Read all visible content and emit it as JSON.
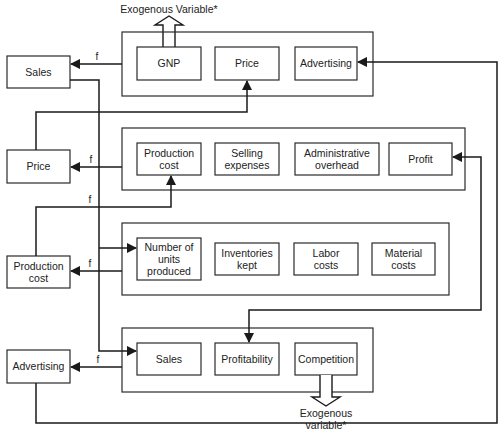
{
  "left_boxes": [
    {
      "label": "Sales"
    },
    {
      "label": "Price"
    },
    {
      "label": "Production",
      "label2": "cost"
    },
    {
      "label": "Advertising"
    }
  ],
  "groups": [
    {
      "items": [
        {
          "label": "GNP"
        },
        {
          "label": "Price"
        },
        {
          "label": "Advertising"
        }
      ]
    },
    {
      "items": [
        {
          "label": "Production",
          "label2": "cost"
        },
        {
          "label": "Selling",
          "label2": "expenses"
        },
        {
          "label": "Administrative",
          "label2": "overhead"
        },
        {
          "label": "Profit"
        }
      ]
    },
    {
      "items": [
        {
          "label": "Number of",
          "label2": "units",
          "label3": "produced"
        },
        {
          "label": "Inventories",
          "label2": "kept"
        },
        {
          "label": "Labor",
          "label2": "costs"
        },
        {
          "label": "Material",
          "label2": "costs"
        }
      ]
    },
    {
      "items": [
        {
          "label": "Sales"
        },
        {
          "label": "Profitability"
        },
        {
          "label": "Competition"
        }
      ]
    }
  ],
  "function_label": "f",
  "exogenous_top": "Exogenous Variable*",
  "exogenous_bottom": {
    "line1": "Exogenous",
    "line2": "variable*"
  }
}
